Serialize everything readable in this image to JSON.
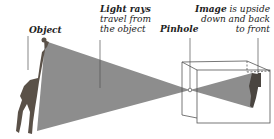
{
  "labels": {
    "object": "Object",
    "light_rays_line1": "Light rays",
    "light_rays_line2": "travel from",
    "light_rays_line3": "the object",
    "pinhole": "Pinhole",
    "image_bold": "Image",
    "image_line1_rest": " is upside",
    "image_line2": "down and back",
    "image_line3": "to front"
  },
  "colors": {
    "rays": "#8a8a8a",
    "lines": "#444444",
    "text": "#222222"
  }
}
